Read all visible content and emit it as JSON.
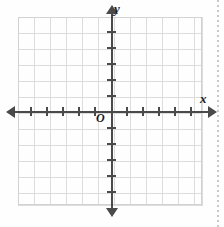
{
  "figure": {
    "type": "coordinate-plane",
    "origin_label": "O",
    "x_axis_label": "x",
    "y_axis_label": "y"
  },
  "chart_data": {
    "type": "scatter",
    "title": "",
    "xlabel": "x",
    "ylabel": "y",
    "origin_label": "O",
    "grid": true,
    "grid_cell_px": 16,
    "xlim": [
      -6,
      6
    ],
    "ylim": [
      -6,
      6
    ],
    "x_tick_values": [
      -5,
      -4,
      -3,
      -2,
      -1,
      1,
      2,
      3,
      4,
      5
    ],
    "y_tick_values": [
      -5,
      -4,
      -3,
      -2,
      -1,
      1,
      2,
      3,
      4,
      5
    ],
    "x_tick_labels": [],
    "y_tick_labels": [],
    "series": [],
    "values": [],
    "legend": [],
    "annotations": []
  },
  "style": {
    "axis_color": "#4a4a4a",
    "grid_color": "#dcdcdc",
    "label_color": "#1c1c1c",
    "background": "#ffffff",
    "margin_dots_color": "#c9c9c9"
  },
  "ticks": {
    "x_positions_px": [
      30,
      46,
      62,
      78,
      94,
      126,
      142,
      158,
      174,
      190
    ],
    "y_positions_px": [
      31,
      47,
      63,
      79,
      95,
      127,
      143,
      159,
      175,
      191
    ]
  }
}
